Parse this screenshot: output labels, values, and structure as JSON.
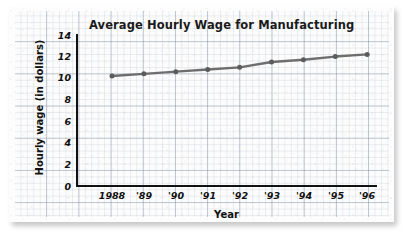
{
  "chart_data": {
    "type": "line",
    "title": "Average Hourly Wage for Manufacturing",
    "xlabel": "Year",
    "ylabel": "Hourly wage (in dollars)",
    "categories": [
      "1988",
      "'89",
      "'90",
      "'91",
      "'92",
      "'93",
      "'94",
      "'95",
      "'96"
    ],
    "values": [
      10.2,
      10.4,
      10.6,
      10.8,
      11.0,
      11.5,
      11.7,
      12.0,
      12.2
    ],
    "series": [
      {
        "name": "Average hourly wage",
        "values": [
          10.2,
          10.4,
          10.6,
          10.8,
          11.0,
          11.5,
          11.7,
          12.0,
          12.2
        ]
      }
    ],
    "yticks": [
      "0",
      "2",
      "4",
      "6",
      "8",
      "10",
      "12",
      "14"
    ],
    "ytick_values": [
      0,
      2,
      4,
      6,
      8,
      10,
      12,
      14
    ],
    "ylim": [
      0,
      14
    ],
    "xlim": [
      1988,
      1996
    ],
    "grid": true,
    "legend": "none",
    "line_color": "#6e6e6e",
    "marker_color": "#5c5c5c",
    "axis_color": "#111111",
    "grid_color": "#7887a0",
    "paper_color": "#fcfcfc"
  }
}
